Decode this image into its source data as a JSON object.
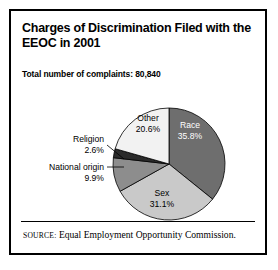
{
  "figure": {
    "title": "Charges of Discrimination Filed with the EEOC in 2001",
    "subtitle": "Total number of complaints: 80,840",
    "source_prefix": "SOURCE:",
    "source_text": "Equal Employment Opportunity Commission.",
    "border_color": "#000000",
    "background_color": "#ffffff"
  },
  "chart_data": {
    "type": "pie",
    "title": "Charges of Discrimination Filed with the EEOC in 2001",
    "subtitle": "Total number of complaints: 80,840",
    "total": 80840,
    "unit": "percent",
    "start_angle_deg": 0,
    "direction": "clockwise",
    "legend": "none",
    "grid": false,
    "categories": [
      "Race",
      "Sex",
      "National origin",
      "Religion",
      "Other"
    ],
    "values": [
      35.8,
      31.1,
      9.9,
      2.6,
      20.6
    ],
    "slices": [
      {
        "label": "Race",
        "value": 35.8,
        "value_text": "35.8%",
        "color": "#6e6e6e",
        "label_placement": "inside",
        "label_color": "#ffffff"
      },
      {
        "label": "Sex",
        "value": 31.1,
        "value_text": "31.1%",
        "color": "#c9c9c9",
        "label_placement": "inside",
        "label_color": "#000000"
      },
      {
        "label": "National origin",
        "value": 9.9,
        "value_text": "9.9%",
        "color": "#8d8d8d",
        "label_placement": "callout-left",
        "label_color": "#000000"
      },
      {
        "label": "Religion",
        "value": 2.6,
        "value_text": "2.6%",
        "color": "#2b2b2b",
        "label_placement": "callout-left",
        "label_color": "#000000"
      },
      {
        "label": "Other",
        "value": 20.6,
        "value_text": "20.6%",
        "color": "#f2f2f2",
        "label_placement": "inside",
        "label_color": "#000000"
      }
    ]
  }
}
